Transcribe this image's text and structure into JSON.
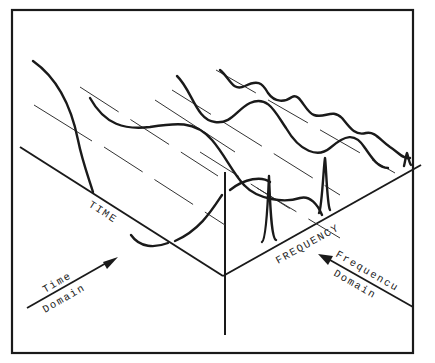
{
  "diagram": {
    "title": "",
    "labels": {
      "time_axis": "TIME",
      "frequency_axis": "FREQUENCY",
      "time_domain_line1": "Time",
      "time_domain_line2": "Domain",
      "frequency_domain_line1": "Frequencu",
      "frequency_domain_line2": "Domain"
    },
    "components": [
      {
        "name": "fundamental",
        "description": "lowest-frequency sine wave (front)"
      },
      {
        "name": "second-harmonic",
        "description": "medium-frequency sine wave"
      },
      {
        "name": "third-harmonic",
        "description": "high-frequency sine wave (back)"
      }
    ],
    "spectral_peaks": 3,
    "colors": {
      "ink": "#1a1a1a",
      "background": "#ffffff"
    }
  }
}
